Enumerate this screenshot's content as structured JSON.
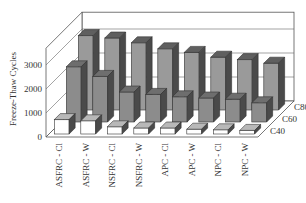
{
  "chart_data": {
    "type": "bar",
    "subtype": "3d-grouped-bar",
    "title": "",
    "xlabel": "",
    "ylabel": "Freeze-Thaw Cycles",
    "zlabel": "",
    "categories": [
      "ASFRC - Cl",
      "ASFRC - W",
      "NSFRC - Cl",
      "NSFRC - W",
      "APC - Cl",
      "APC - W",
      "NPC - Cl",
      "NPC - W"
    ],
    "depth_categories": [
      "C40",
      "C60",
      "C80"
    ],
    "series": [
      {
        "name": "C40",
        "values": [
          600,
          550,
          300,
          250,
          250,
          200,
          175,
          150
        ],
        "color": "#ffffff",
        "top_color": "#b8b8b8"
      },
      {
        "name": "C60",
        "values": [
          2300,
          1900,
          1250,
          1150,
          1050,
          1000,
          950,
          800
        ],
        "color": "#8c8c8c",
        "top_color": "#6e6e6e"
      },
      {
        "name": "C80",
        "values": [
          3100,
          3000,
          2800,
          2550,
          2400,
          2200,
          2100,
          1950
        ],
        "color": "#9a9a9a",
        "top_color": "#5f5f5f"
      }
    ],
    "yticks": [
      0,
      1000,
      2000,
      3000
    ],
    "ylim": [
      0,
      3700
    ],
    "grid": true,
    "legend": "none (depth axis labels C40/C60/C80 on right)"
  }
}
